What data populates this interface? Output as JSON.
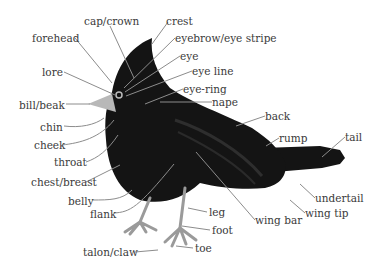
{
  "diagram": {
    "colors": {
      "body": "#141414",
      "beak": "#b8b8b8",
      "legs": "#9a9a9a",
      "leader_lines": "#8c8c8c",
      "text": "#3a3a3a",
      "background": "#ffffff"
    },
    "labels": [
      {
        "id": "cap-crown",
        "text": "cap/crown",
        "x": 84,
        "y": 16
      },
      {
        "id": "crest",
        "text": "crest",
        "x": 166,
        "y": 16
      },
      {
        "id": "forehead",
        "text": "forehead",
        "x": 32,
        "y": 33
      },
      {
        "id": "eyebrow-eye-stripe",
        "text": "eyebrow/eye stripe",
        "x": 175,
        "y": 33
      },
      {
        "id": "eye",
        "text": "eye",
        "x": 180,
        "y": 51
      },
      {
        "id": "lore",
        "text": "lore",
        "x": 42,
        "y": 67
      },
      {
        "id": "eye-line",
        "text": "eye line",
        "x": 192,
        "y": 66
      },
      {
        "id": "eye-ring",
        "text": "eye-ring",
        "x": 183,
        "y": 84
      },
      {
        "id": "bill-beak",
        "text": "bill/beak",
        "x": 19,
        "y": 100
      },
      {
        "id": "nape",
        "text": "nape",
        "x": 212,
        "y": 97
      },
      {
        "id": "back",
        "text": "back",
        "x": 265,
        "y": 111
      },
      {
        "id": "chin",
        "text": "chin",
        "x": 40,
        "y": 122
      },
      {
        "id": "rump",
        "text": "rump",
        "x": 279,
        "y": 133
      },
      {
        "id": "tail",
        "text": "tail",
        "x": 345,
        "y": 132
      },
      {
        "id": "cheek",
        "text": "cheek",
        "x": 34,
        "y": 140
      },
      {
        "id": "throat",
        "text": "throat",
        "x": 54,
        "y": 157
      },
      {
        "id": "chest-breast",
        "text": "chest/breast",
        "x": 31,
        "y": 177
      },
      {
        "id": "belly",
        "text": "belly",
        "x": 68,
        "y": 196
      },
      {
        "id": "undertail",
        "text": "undertail",
        "x": 315,
        "y": 193
      },
      {
        "id": "flank",
        "text": "flank",
        "x": 90,
        "y": 209
      },
      {
        "id": "leg",
        "text": "leg",
        "x": 209,
        "y": 207
      },
      {
        "id": "wing-tip",
        "text": "wing tip",
        "x": 305,
        "y": 208
      },
      {
        "id": "wing-bar",
        "text": "wing bar",
        "x": 255,
        "y": 215
      },
      {
        "id": "foot",
        "text": "foot",
        "x": 212,
        "y": 225
      },
      {
        "id": "toe",
        "text": "toe",
        "x": 195,
        "y": 243
      },
      {
        "id": "talon-claw",
        "text": "talon/claw",
        "x": 83,
        "y": 247
      }
    ]
  }
}
